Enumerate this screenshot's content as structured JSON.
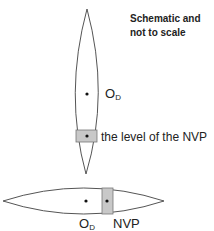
{
  "note": {
    "line1": "Schematic and",
    "line2": "not to scale"
  },
  "vertical_lens": {
    "center_label_main": "O",
    "center_label_sub": "D",
    "nvp_label": "the level of the NVP"
  },
  "horizontal_lens": {
    "center_label_main": "O",
    "center_label_sub": "D",
    "nvp_label": "NVP"
  },
  "colors": {
    "outline": "#555555",
    "nvp_fill": "#c8c8c8",
    "dot": "#111111"
  }
}
